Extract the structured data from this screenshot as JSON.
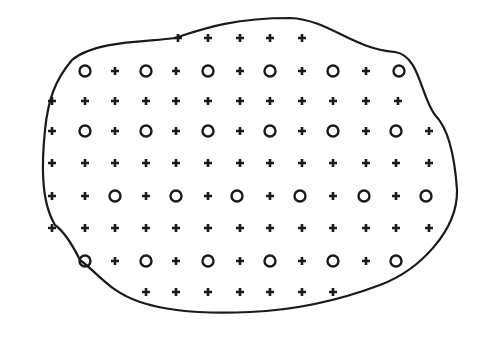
{
  "diagram": {
    "colors": {
      "stroke": "#1a1a1a",
      "background": "#ffffff"
    },
    "outline": "M72,60 C95,40 150,42 175,38 C200,30 230,18 290,18 C330,20 350,48 395,52 C420,56 420,95 435,115 C450,130 455,160 457,190 C458,230 420,270 380,285 C340,300 300,310 250,312 C210,314 170,312 140,302 C110,292 100,275 80,260 C70,240 62,230 55,225 C40,200 42,160 45,130 C48,100 55,80 72,60 Z",
    "symbol_legend": {
      "plus": "+",
      "circle": "O"
    },
    "rows": [
      {
        "y": 38,
        "items": [
          [
            "plus",
            178
          ],
          [
            "plus",
            208
          ],
          [
            "plus",
            240
          ],
          [
            "plus",
            270
          ],
          [
            "plus",
            302
          ]
        ]
      },
      {
        "y": 71,
        "items": [
          [
            "circle",
            85
          ],
          [
            "plus",
            115
          ],
          [
            "circle",
            146
          ],
          [
            "plus",
            176
          ],
          [
            "circle",
            208
          ],
          [
            "plus",
            240
          ],
          [
            "circle",
            270
          ],
          [
            "plus",
            302
          ],
          [
            "circle",
            333
          ],
          [
            "plus",
            366
          ],
          [
            "circle",
            399
          ]
        ]
      },
      {
        "y": 101,
        "items": [
          [
            "plus",
            52
          ],
          [
            "plus",
            85
          ],
          [
            "plus",
            115
          ],
          [
            "plus",
            146
          ],
          [
            "plus",
            176
          ],
          [
            "plus",
            208
          ],
          [
            "plus",
            240
          ],
          [
            "plus",
            270
          ],
          [
            "plus",
            302
          ],
          [
            "plus",
            333
          ],
          [
            "plus",
            366
          ],
          [
            "plus",
            398
          ]
        ]
      },
      {
        "y": 131,
        "items": [
          [
            "plus",
            52
          ],
          [
            "circle",
            85
          ],
          [
            "plus",
            115
          ],
          [
            "circle",
            146
          ],
          [
            "plus",
            176
          ],
          [
            "circle",
            208
          ],
          [
            "plus",
            240
          ],
          [
            "circle",
            270
          ],
          [
            "plus",
            302
          ],
          [
            "circle",
            333
          ],
          [
            "plus",
            366
          ],
          [
            "circle",
            396
          ],
          [
            "plus",
            429
          ]
        ]
      },
      {
        "y": 163,
        "items": [
          [
            "plus",
            52
          ],
          [
            "plus",
            85
          ],
          [
            "plus",
            115
          ],
          [
            "plus",
            146
          ],
          [
            "plus",
            176
          ],
          [
            "plus",
            208
          ],
          [
            "plus",
            240
          ],
          [
            "plus",
            270
          ],
          [
            "plus",
            302
          ],
          [
            "plus",
            333
          ],
          [
            "plus",
            366
          ],
          [
            "plus",
            396
          ],
          [
            "plus",
            429
          ]
        ]
      },
      {
        "y": 196,
        "items": [
          [
            "plus",
            52
          ],
          [
            "plus",
            85
          ],
          [
            "circle",
            115
          ],
          [
            "plus",
            146
          ],
          [
            "circle",
            176
          ],
          [
            "plus",
            208
          ],
          [
            "circle",
            237
          ],
          [
            "plus",
            270
          ],
          [
            "circle",
            300
          ],
          [
            "plus",
            333
          ],
          [
            "circle",
            364
          ],
          [
            "plus",
            396
          ],
          [
            "circle",
            426
          ]
        ]
      },
      {
        "y": 228,
        "items": [
          [
            "plus",
            52
          ],
          [
            "plus",
            85
          ],
          [
            "plus",
            115
          ],
          [
            "plus",
            146
          ],
          [
            "plus",
            176
          ],
          [
            "plus",
            208
          ],
          [
            "plus",
            240
          ],
          [
            "plus",
            270
          ],
          [
            "plus",
            302
          ],
          [
            "plus",
            333
          ],
          [
            "plus",
            366
          ],
          [
            "plus",
            396
          ],
          [
            "plus",
            429
          ]
        ]
      },
      {
        "y": 261,
        "items": [
          [
            "circle",
            85
          ],
          [
            "plus",
            115
          ],
          [
            "circle",
            146
          ],
          [
            "plus",
            176
          ],
          [
            "circle",
            208
          ],
          [
            "plus",
            240
          ],
          [
            "circle",
            270
          ],
          [
            "plus",
            302
          ],
          [
            "circle",
            333
          ],
          [
            "plus",
            366
          ],
          [
            "circle",
            396
          ]
        ]
      },
      {
        "y": 292,
        "items": [
          [
            "plus",
            146
          ],
          [
            "plus",
            176
          ],
          [
            "plus",
            208
          ],
          [
            "plus",
            240
          ],
          [
            "plus",
            270
          ],
          [
            "plus",
            302
          ],
          [
            "plus",
            333
          ]
        ]
      }
    ]
  }
}
